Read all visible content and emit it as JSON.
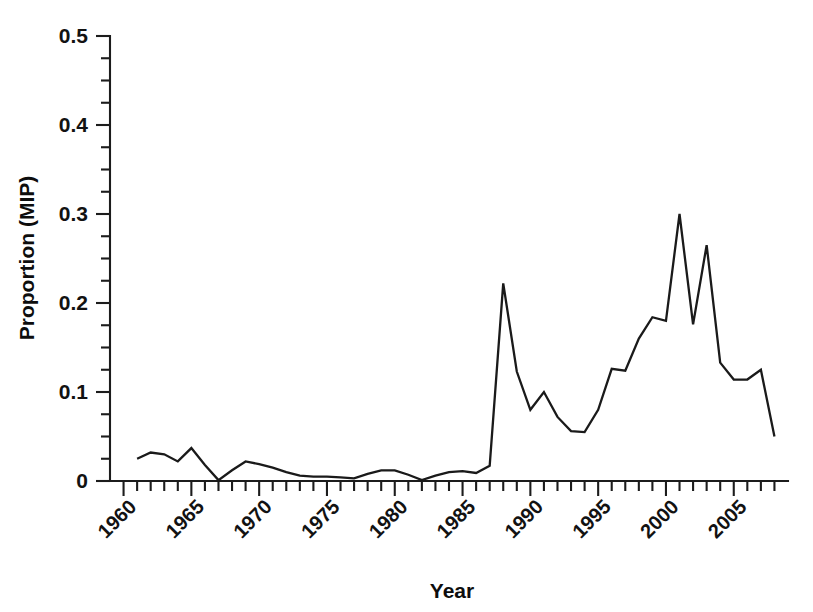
{
  "chart_data": {
    "type": "line",
    "title": "",
    "xlabel": "Year",
    "ylabel": "Proportion (MIP)",
    "xlim": [
      1959,
      2009
    ],
    "ylim": [
      0,
      0.5
    ],
    "grid": false,
    "legend": "none",
    "y_ticks_major": [
      0,
      0.1,
      0.2,
      0.3,
      0.4,
      0.5
    ],
    "y_tick_labels": [
      "0",
      "0.1",
      "0.2",
      "0.3",
      "0.4",
      "0.5"
    ],
    "y_minor_step": 0.025,
    "x_ticks_major": [
      1960,
      1965,
      1970,
      1975,
      1980,
      1985,
      1990,
      1995,
      2000,
      2005
    ],
    "x_tick_labels": [
      "1960",
      "1965",
      "1970",
      "1975",
      "1980",
      "1985",
      "1990",
      "1995",
      "2000",
      "2005"
    ],
    "x_minor_step": 1,
    "x_tick_label_rotation": -45,
    "series": [
      {
        "name": "Proportion (MIP)",
        "color": "#1a1a1a",
        "x": [
          1961,
          1962,
          1963,
          1964,
          1965,
          1966,
          1967,
          1968,
          1969,
          1970,
          1971,
          1972,
          1973,
          1974,
          1975,
          1976,
          1977,
          1978,
          1979,
          1980,
          1981,
          1982,
          1983,
          1984,
          1985,
          1986,
          1987,
          1988,
          1989,
          1990,
          1991,
          1992,
          1993,
          1994,
          1995,
          1996,
          1997,
          1998,
          1999,
          2000,
          2001,
          2002,
          2003,
          2004,
          2005,
          2006,
          2007,
          2008
        ],
        "values": [
          0.025,
          0.032,
          0.03,
          0.022,
          0.037,
          0.018,
          0.001,
          0.012,
          0.022,
          0.019,
          0.015,
          0.01,
          0.006,
          0.005,
          0.005,
          0.004,
          0.003,
          0.008,
          0.012,
          0.012,
          0.007,
          0.001,
          0.006,
          0.01,
          0.011,
          0.009,
          0.017,
          0.222,
          0.123,
          0.08,
          0.1,
          0.072,
          0.056,
          0.055,
          0.08,
          0.126,
          0.124,
          0.16,
          0.184,
          0.18,
          0.3,
          0.176,
          0.265,
          0.133,
          0.114,
          0.114,
          0.125,
          0.05
        ]
      }
    ]
  },
  "axes": {
    "y_title": "Proportion (MIP)",
    "x_title": "Year"
  }
}
